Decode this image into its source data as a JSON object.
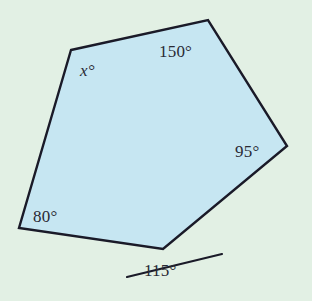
{
  "figure": {
    "kind": "polygon-angle-diagram",
    "canvas": {
      "width": 312,
      "height": 301
    },
    "colors": {
      "background": "#e2f0e4",
      "polygon_fill": "#c6e6f2",
      "stroke": "#1a1a28",
      "text": "#2a2a35"
    },
    "polygon": {
      "name": "pentagon",
      "sides": 5,
      "vertices": [
        {
          "id": "top-left",
          "x": 71,
          "y": 50
        },
        {
          "id": "top",
          "x": 208,
          "y": 20
        },
        {
          "id": "right",
          "x": 287,
          "y": 146
        },
        {
          "id": "bottom",
          "x": 163,
          "y": 249
        },
        {
          "id": "bottom-left",
          "x": 19,
          "y": 228
        }
      ],
      "points_attr": "71,50 208,20 287,146 163,249 19,228"
    },
    "transversal": {
      "id": "extended-side-ray",
      "x1": 127,
      "y1": 277,
      "x2": 222,
      "y2": 254
    },
    "labels": [
      {
        "id": "angle-150",
        "text": "150°",
        "vertex": "top",
        "kind": "interior",
        "value": 150,
        "x": 159,
        "y": 43
      },
      {
        "id": "angle-x",
        "text": "x°",
        "vertex": "top-left",
        "kind": "interior",
        "value": null,
        "x": 80,
        "y": 62
      },
      {
        "id": "angle-95",
        "text": "95°",
        "vertex": "right",
        "kind": "interior",
        "value": 95,
        "x": 235,
        "y": 143
      },
      {
        "id": "angle-80",
        "text": "80°",
        "vertex": "bottom-left",
        "kind": "interior",
        "value": 80,
        "x": 33,
        "y": 208
      },
      {
        "id": "angle-115",
        "text": "115°",
        "vertex": "bottom",
        "kind": "exterior",
        "value": 115,
        "x": 144,
        "y": 262
      }
    ]
  }
}
